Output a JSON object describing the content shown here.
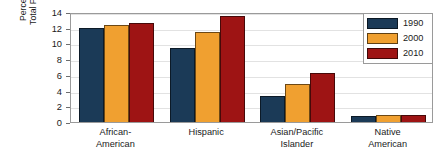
{
  "chart_data": {
    "type": "bar",
    "title": "",
    "xlabel": "",
    "ylabel": "Percent of the Total Population",
    "ylabel_line1": "Percent of the",
    "ylabel_line2": "Total Population",
    "categories": [
      "African-\nAmerican",
      "Hispanic",
      "Asian/Pacific\nIslander",
      "Native\nAmerican"
    ],
    "category_lines": [
      [
        "African-",
        "American"
      ],
      [
        "Hispanic",
        ""
      ],
      [
        "Asian/Pacific",
        "Islander"
      ],
      [
        "Native",
        "American"
      ]
    ],
    "series": [
      {
        "name": "1990",
        "color": "#1b3a57",
        "values": [
          12.0,
          9.4,
          3.3,
          0.8
        ]
      },
      {
        "name": "2000",
        "color": "#f0a030",
        "values": [
          12.3,
          11.5,
          4.8,
          0.9
        ]
      },
      {
        "name": "2010",
        "color": "#9e1414",
        "values": [
          12.6,
          13.5,
          6.2,
          0.9
        ]
      }
    ],
    "ylim": [
      0,
      14
    ],
    "yticks": [
      0,
      2,
      4,
      6,
      8,
      10,
      12,
      14
    ],
    "ytick_labels": [
      "0",
      "2",
      "4",
      "6",
      "8",
      "10",
      "12",
      "14"
    ],
    "grid": true,
    "legend_position": "top-right",
    "legend_entries": [
      "1990",
      "2000",
      "2010"
    ]
  },
  "colors": {
    "series_1990": "#1b3a57",
    "series_2000": "#f0a030",
    "series_2010": "#9e1414",
    "axis": "#9a9a9a",
    "grid": "#e2e2e2",
    "text": "#1a1a1a",
    "background": "#ffffff"
  }
}
